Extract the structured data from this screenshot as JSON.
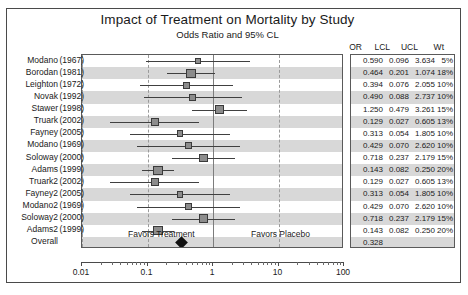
{
  "header": {
    "title": "Impact of Treatment on Mortality by Study",
    "subtitle": "Odds Ratio and 95% CL"
  },
  "table_headers": {
    "or": "OR",
    "lcl": "LCL",
    "ucl": "UCL",
    "wt": "Wt"
  },
  "annotations": {
    "favors_treatment": "Favors Treatment",
    "favors_placebo": "Favors Placebo"
  },
  "axis": {
    "ticks": [
      "0.01",
      "0.1",
      "1",
      "10",
      "100"
    ]
  },
  "chart_data": {
    "type": "forest",
    "title": "Impact of Treatment on Mortality by Study",
    "subtitle": "Odds Ratio and 95% CL",
    "xlabel": "",
    "ylabel": "",
    "xscale": "log",
    "xlim": [
      0.01,
      100
    ],
    "grid": true,
    "reference_line": 1,
    "columns": [
      "OR",
      "LCL",
      "UCL",
      "Wt"
    ],
    "rows": [
      {
        "name": "Modano",
        "year": "(1967)",
        "or": "0.590",
        "lcl": "0.096",
        "ucl": "3.634",
        "wt": "5%",
        "or_v": 0.59,
        "lcl_v": 0.096,
        "ucl_v": 3.634,
        "wt_v": 5
      },
      {
        "name": "Borodan",
        "year": "(1981)",
        "or": "0.464",
        "lcl": "0.201",
        "ucl": "1.074",
        "wt": "18%",
        "or_v": 0.464,
        "lcl_v": 0.201,
        "ucl_v": 1.074,
        "wt_v": 18
      },
      {
        "name": "Leighton",
        "year": "(1972)",
        "or": "0.394",
        "lcl": "0.076",
        "ucl": "2.055",
        "wt": "10%",
        "or_v": 0.394,
        "lcl_v": 0.076,
        "ucl_v": 2.055,
        "wt_v": 10
      },
      {
        "name": "Novak",
        "year": "(1992)",
        "or": "0.490",
        "lcl": "0.088",
        "ucl": "2.737",
        "wt": "10%",
        "or_v": 0.49,
        "lcl_v": 0.088,
        "ucl_v": 2.737,
        "wt_v": 10
      },
      {
        "name": "Stawer",
        "year": "(1998)",
        "or": "1.250",
        "lcl": "0.479",
        "ucl": "3.261",
        "wt": "15%",
        "or_v": 1.25,
        "lcl_v": 0.479,
        "ucl_v": 3.261,
        "wt_v": 15
      },
      {
        "name": "Truark",
        "year": "(2002)",
        "or": "0.129",
        "lcl": "0.027",
        "ucl": "0.605",
        "wt": "13%",
        "or_v": 0.129,
        "lcl_v": 0.027,
        "ucl_v": 0.605,
        "wt_v": 13
      },
      {
        "name": "Fayney",
        "year": "(2005)",
        "or": "0.313",
        "lcl": "0.054",
        "ucl": "1.805",
        "wt": "10%",
        "or_v": 0.313,
        "lcl_v": 0.054,
        "ucl_v": 1.805,
        "wt_v": 10
      },
      {
        "name": "Modano",
        "year": "(1969)",
        "or": "0.429",
        "lcl": "0.070",
        "ucl": "2.620",
        "wt": "10%",
        "or_v": 0.429,
        "lcl_v": 0.07,
        "ucl_v": 2.62,
        "wt_v": 10
      },
      {
        "name": "Soloway",
        "year": "(2000)",
        "or": "0.718",
        "lcl": "0.237",
        "ucl": "2.179",
        "wt": "15%",
        "or_v": 0.718,
        "lcl_v": 0.237,
        "ucl_v": 2.179,
        "wt_v": 15
      },
      {
        "name": "Adams",
        "year": "(1999)",
        "or": "0.143",
        "lcl": "0.082",
        "ucl": "0.250",
        "wt": "20%",
        "or_v": 0.143,
        "lcl_v": 0.082,
        "ucl_v": 0.25,
        "wt_v": 20
      },
      {
        "name": "Truark2",
        "year": "(2002)",
        "or": "0.129",
        "lcl": "0.027",
        "ucl": "0.605",
        "wt": "13%",
        "or_v": 0.129,
        "lcl_v": 0.027,
        "ucl_v": 0.605,
        "wt_v": 13
      },
      {
        "name": "Fayney2",
        "year": "(2005)",
        "or": "0.313",
        "lcl": "0.054",
        "ucl": "1.805",
        "wt": "10%",
        "or_v": 0.313,
        "lcl_v": 0.054,
        "ucl_v": 1.805,
        "wt_v": 10
      },
      {
        "name": "Modano2",
        "year": "(1969)",
        "or": "0.429",
        "lcl": "0.070",
        "ucl": "2.620",
        "wt": "10%",
        "or_v": 0.429,
        "lcl_v": 0.07,
        "ucl_v": 2.62,
        "wt_v": 10
      },
      {
        "name": "Soloway2",
        "year": "(2000)",
        "or": "0.718",
        "lcl": "0.237",
        "ucl": "2.179",
        "wt": "15%",
        "or_v": 0.718,
        "lcl_v": 0.237,
        "ucl_v": 2.179,
        "wt_v": 15
      },
      {
        "name": "Adams2",
        "year": "(1999)",
        "or": "0.143",
        "lcl": "0.082",
        "ucl": "0.250",
        "wt": "20%",
        "or_v": 0.143,
        "lcl_v": 0.082,
        "ucl_v": 0.25,
        "wt_v": 20
      },
      {
        "name": "Overall",
        "year": "",
        "or": "0.328",
        "lcl": "",
        "ucl": "",
        "wt": "",
        "or_v": 0.328,
        "lcl_v": null,
        "ucl_v": null,
        "wt_v": null,
        "summary": true
      }
    ]
  },
  "colors": {
    "marker": "#8c8c8c",
    "marker_edge": "#3a3a3a",
    "band": "#d8d8d8",
    "diamond": "#111111",
    "frame": "#4a4a4a"
  }
}
